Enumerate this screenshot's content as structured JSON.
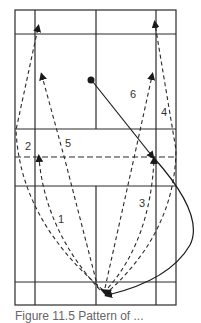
{
  "figure": {
    "type": "badminton-court-shot-diagram",
    "labels": {
      "shot1": "1",
      "shot2": "2",
      "shot3": "3",
      "shot4": "4",
      "shot5": "5",
      "shot6": "6"
    },
    "caption": "Figure 11.5  Pattern of ..."
  },
  "colors": {
    "line": "#2a2a2a",
    "background": "#ffffff",
    "label": "#333333"
  }
}
